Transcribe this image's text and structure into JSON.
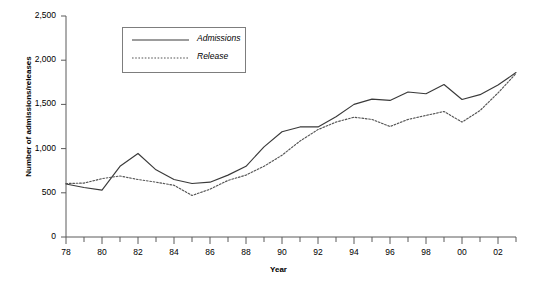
{
  "chart_data": {
    "type": "line",
    "title": "",
    "xlabel": "Year",
    "ylabel": "Number of admissions/releases",
    "xlim": [
      1978,
      2003
    ],
    "ylim": [
      0,
      2500
    ],
    "grid": false,
    "legend_position": "top-left-inside",
    "y_ticks": [
      0,
      500,
      1000,
      1500,
      2000,
      2500
    ],
    "y_tick_labels": [
      "0",
      "500",
      "1,000",
      "1,500",
      "2,000",
      "2,500"
    ],
    "x_ticks": [
      1978,
      1979,
      1980,
      1981,
      1982,
      1983,
      1984,
      1985,
      1986,
      1987,
      1988,
      1989,
      1990,
      1991,
      1992,
      1993,
      1994,
      1995,
      1996,
      1997,
      1998,
      1999,
      2000,
      2001,
      2002,
      2003
    ],
    "x_tick_labels_major": [
      {
        "x": 1978,
        "label": "78"
      },
      {
        "x": 1980,
        "label": "80"
      },
      {
        "x": 1982,
        "label": "82"
      },
      {
        "x": 1984,
        "label": "84"
      },
      {
        "x": 1986,
        "label": "86"
      },
      {
        "x": 1988,
        "label": "88"
      },
      {
        "x": 1990,
        "label": "90"
      },
      {
        "x": 1992,
        "label": "92"
      },
      {
        "x": 1994,
        "label": "94"
      },
      {
        "x": 1996,
        "label": "96"
      },
      {
        "x": 1998,
        "label": "98"
      },
      {
        "x": 2000,
        "label": "00"
      },
      {
        "x": 2002,
        "label": "02"
      }
    ],
    "x": [
      1978,
      1979,
      1980,
      1981,
      1982,
      1983,
      1984,
      1985,
      1986,
      1987,
      1988,
      1989,
      1990,
      1991,
      1992,
      1993,
      1994,
      1995,
      1996,
      1997,
      1998,
      1999,
      2000,
      2001,
      2002,
      2003
    ],
    "series": [
      {
        "name": "Admissions",
        "style": "solid",
        "color": "#3a3a3a",
        "values": [
          600,
          560,
          530,
          800,
          945,
          760,
          650,
          605,
          620,
          700,
          800,
          1020,
          1190,
          1245,
          1245,
          1360,
          1500,
          1560,
          1545,
          1640,
          1620,
          1725,
          1555,
          1610,
          1720,
          1860
        ]
      },
      {
        "name": "Release",
        "style": "dotted",
        "color": "#555555",
        "values": [
          605,
          610,
          660,
          690,
          650,
          620,
          585,
          470,
          540,
          640,
          700,
          800,
          925,
          1085,
          1215,
          1300,
          1355,
          1330,
          1250,
          1330,
          1375,
          1420,
          1300,
          1430,
          1630,
          1850
        ]
      }
    ]
  },
  "legend": {
    "items": [
      {
        "label": "Admissions",
        "style": "solid"
      },
      {
        "label": "Release",
        "style": "dotted"
      }
    ]
  }
}
